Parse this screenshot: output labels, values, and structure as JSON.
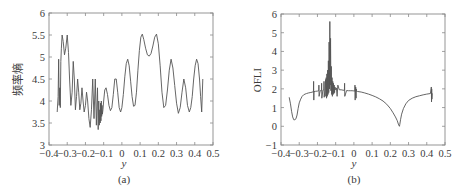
{
  "chart_data": [
    {
      "id": "a",
      "type": "line",
      "caption": "(a)",
      "title": "",
      "xlabel": "y",
      "ylabel": "频率熵",
      "xlim": [
        -0.4,
        0.5
      ],
      "ylim": [
        3,
        6
      ],
      "xticks": [
        -0.4,
        -0.3,
        -0.2,
        -0.1,
        0,
        0.1,
        0.2,
        0.3,
        0.4,
        0.5
      ],
      "xtick_labels": [
        "−0.4",
        "−0.3",
        "−0.2",
        "−0.1",
        "0",
        "0.1",
        "0.2",
        "0.3",
        "0.4",
        "0.5"
      ],
      "yticks": [
        3,
        3.5,
        4,
        4.5,
        5,
        5.5,
        6
      ],
      "ytick_labels": [
        "3",
        "3.5",
        "4",
        "4.5",
        "5",
        "5.5",
        "6"
      ],
      "grid": false,
      "legend": null,
      "series": [
        {
          "name": "frequency entropy",
          "x": [
            -0.355,
            -0.35,
            -0.347,
            -0.344,
            -0.341,
            -0.338,
            -0.335,
            -0.332,
            -0.328,
            -0.322,
            -0.315,
            -0.308,
            -0.3,
            -0.293,
            -0.287,
            -0.28,
            -0.273,
            -0.267,
            -0.261,
            -0.255,
            -0.249,
            -0.243,
            -0.237,
            -0.231,
            -0.225,
            -0.219,
            -0.213,
            -0.207,
            -0.2,
            -0.194,
            -0.188,
            -0.181,
            -0.174,
            -0.167,
            -0.16,
            -0.153,
            -0.146,
            -0.14,
            -0.134,
            -0.13,
            -0.127,
            -0.124,
            -0.121,
            -0.119,
            -0.117,
            -0.115,
            -0.113,
            -0.111,
            -0.109,
            -0.107,
            -0.104,
            -0.1,
            -0.094,
            -0.087,
            -0.079,
            -0.071,
            -0.063,
            -0.055,
            -0.047,
            -0.039,
            -0.031,
            -0.023,
            -0.015,
            -0.007,
            0.0,
            0.008,
            0.016,
            0.024,
            0.032,
            0.04,
            0.048,
            0.056,
            0.064,
            0.072,
            0.08,
            0.088,
            0.096,
            0.104,
            0.112,
            0.12,
            0.13,
            0.14,
            0.15,
            0.16,
            0.17,
            0.18,
            0.19,
            0.2,
            0.21,
            0.22,
            0.23,
            0.24,
            0.25,
            0.26,
            0.27,
            0.28,
            0.29,
            0.3,
            0.31,
            0.32,
            0.33,
            0.34,
            0.35,
            0.36,
            0.37,
            0.378,
            0.386,
            0.394,
            0.402,
            0.41,
            0.418,
            0.426,
            0.432,
            0.438,
            0.444
          ],
          "values": [
            3.75,
            4.1,
            4.95,
            3.9,
            4.3,
            3.85,
            4.9,
            5.2,
            5.5,
            5.35,
            5.05,
            5.2,
            5.5,
            5.1,
            4.5,
            3.9,
            4.2,
            4.9,
            4.5,
            3.8,
            4.1,
            4.5,
            4.2,
            3.8,
            3.95,
            4.3,
            4.0,
            3.75,
            3.9,
            4.2,
            4.0,
            3.6,
            3.4,
            3.8,
            4.5,
            3.6,
            4.5,
            3.45,
            4.3,
            3.35,
            4.0,
            3.45,
            3.8,
            3.5,
            3.95,
            3.55,
            4.0,
            3.65,
            3.9,
            3.7,
            3.8,
            4.0,
            4.25,
            4.3,
            4.15,
            3.9,
            3.78,
            3.85,
            4.15,
            4.5,
            4.5,
            4.2,
            3.85,
            3.75,
            3.85,
            4.15,
            4.55,
            4.85,
            4.95,
            4.8,
            4.45,
            4.1,
            3.88,
            3.9,
            4.2,
            4.7,
            5.15,
            5.45,
            5.52,
            5.4,
            5.2,
            5.05,
            5.02,
            5.08,
            5.25,
            5.45,
            5.52,
            5.3,
            4.8,
            4.2,
            3.85,
            3.9,
            4.25,
            4.7,
            4.95,
            4.75,
            4.35,
            3.95,
            3.72,
            3.85,
            4.2,
            4.5,
            4.3,
            3.9,
            3.75,
            3.85,
            4.1,
            4.5,
            4.8,
            4.95,
            4.85,
            4.5,
            4.1,
            3.75,
            4.5
          ]
        }
      ]
    },
    {
      "id": "b",
      "type": "line",
      "caption": "(b)",
      "title": "",
      "xlabel": "y",
      "ylabel": "OFLI",
      "xlim": [
        -0.4,
        0.5
      ],
      "ylim": [
        -1,
        6
      ],
      "xticks": [
        -0.4,
        -0.3,
        -0.2,
        -0.1,
        0,
        0.1,
        0.2,
        0.3,
        0.4,
        0.5
      ],
      "xtick_labels": [
        "−0.4",
        "−0.3",
        "−0.2",
        "−0.1",
        "0",
        "0.1",
        "0.2",
        "0.3",
        "0.4",
        "0.5"
      ],
      "yticks": [
        -1,
        0,
        1,
        2,
        3,
        4,
        5,
        6
      ],
      "ytick_labels": [
        "−1",
        "0",
        "1",
        "2",
        "3",
        "4",
        "5",
        "6"
      ],
      "grid": false,
      "legend": null,
      "series": [
        {
          "name": "OFLI",
          "x": [
            -0.355,
            -0.348,
            -0.342,
            -0.336,
            -0.33,
            -0.324,
            -0.318,
            -0.312,
            -0.306,
            -0.3,
            -0.292,
            -0.284,
            -0.276,
            -0.268,
            -0.26,
            -0.25,
            -0.24,
            -0.23,
            -0.222,
            -0.221,
            -0.22,
            -0.219,
            -0.21,
            -0.2,
            -0.193,
            -0.192,
            -0.191,
            -0.185,
            -0.178,
            -0.177,
            -0.176,
            -0.17,
            -0.165,
            -0.164,
            -0.163,
            -0.158,
            -0.155,
            -0.154,
            -0.152,
            -0.15,
            -0.148,
            -0.146,
            -0.144,
            -0.142,
            -0.14,
            -0.138,
            -0.136,
            -0.134,
            -0.132,
            -0.13,
            -0.128,
            -0.126,
            -0.124,
            -0.122,
            -0.12,
            -0.118,
            -0.116,
            -0.114,
            -0.112,
            -0.11,
            -0.108,
            -0.106,
            -0.104,
            -0.1,
            -0.096,
            -0.092,
            -0.088,
            -0.08,
            -0.07,
            -0.06,
            -0.052,
            -0.051,
            -0.05,
            -0.04,
            -0.03,
            -0.02,
            -0.01,
            0.0,
            0.005,
            0.006,
            0.007,
            0.008,
            0.01,
            0.012,
            0.013,
            0.014,
            0.02,
            0.04,
            0.06,
            0.08,
            0.1,
            0.12,
            0.14,
            0.16,
            0.18,
            0.2,
            0.215,
            0.228,
            0.238,
            0.244,
            0.248,
            0.25,
            0.252,
            0.256,
            0.262,
            0.272,
            0.285,
            0.3,
            0.32,
            0.34,
            0.36,
            0.38,
            0.4,
            0.42,
            0.425,
            0.426,
            0.427,
            0.428,
            0.43
          ],
          "values": [
            1.55,
            1.2,
            0.8,
            0.5,
            0.35,
            0.35,
            0.4,
            0.6,
            0.95,
            1.25,
            1.45,
            1.6,
            1.68,
            1.72,
            1.75,
            1.78,
            1.8,
            1.82,
            1.85,
            2.4,
            1.4,
            1.85,
            1.87,
            1.88,
            1.9,
            2.2,
            1.6,
            1.9,
            1.92,
            2.3,
            1.5,
            1.93,
            1.95,
            2.4,
            1.55,
            2.0,
            2.5,
            1.6,
            2.6,
            1.5,
            2.8,
            1.6,
            3.0,
            1.7,
            3.5,
            1.8,
            4.5,
            2.0,
            5.6,
            2.2,
            4.7,
            1.9,
            3.2,
            1.7,
            2.6,
            1.6,
            2.4,
            1.7,
            2.3,
            1.75,
            2.2,
            1.8,
            2.1,
            1.95,
            2.05,
            1.6,
            2.2,
            1.95,
            1.95,
            1.93,
            1.92,
            2.3,
            1.6,
            1.91,
            1.9,
            1.9,
            1.9,
            1.89,
            1.88,
            2.2,
            1.4,
            1.88,
            2.1,
            1.5,
            2.0,
            1.87,
            1.86,
            1.83,
            1.78,
            1.72,
            1.65,
            1.57,
            1.47,
            1.35,
            1.18,
            0.95,
            0.72,
            0.5,
            0.3,
            0.12,
            0.03,
            0.0,
            0.1,
            0.35,
            0.65,
            0.95,
            1.2,
            1.38,
            1.5,
            1.58,
            1.63,
            1.68,
            1.72,
            1.75,
            2.1,
            1.3,
            2.0,
            1.45,
            1.76
          ]
        }
      ]
    }
  ]
}
